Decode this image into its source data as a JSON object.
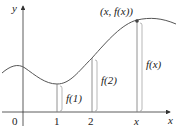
{
  "diagram": {
    "axis_labels": {
      "y": "y",
      "x": "x",
      "origin": "0"
    },
    "tick_labels": [
      "1",
      "2",
      "x"
    ],
    "point_label": "(x, f(x))",
    "height_labels": [
      "f(1)",
      "f(2)",
      "f(x)"
    ],
    "colors": {
      "curve": "#555555",
      "axis": "#333333",
      "lines": "#777777"
    }
  }
}
